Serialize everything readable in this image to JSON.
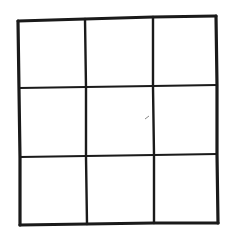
{
  "diagram": {
    "type": "grid",
    "rows": 3,
    "columns": 3,
    "stroke_color": "#1a1a1a",
    "background": "#ffffff",
    "cells": [
      {
        "row": 0,
        "col": 0,
        "content": ""
      },
      {
        "row": 0,
        "col": 1,
        "content": ""
      },
      {
        "row": 0,
        "col": 2,
        "content": ""
      },
      {
        "row": 1,
        "col": 0,
        "content": ""
      },
      {
        "row": 1,
        "col": 1,
        "content": ""
      },
      {
        "row": 1,
        "col": 2,
        "content": ""
      },
      {
        "row": 2,
        "col": 0,
        "content": ""
      },
      {
        "row": 2,
        "col": 1,
        "content": ""
      },
      {
        "row": 2,
        "col": 2,
        "content": ""
      }
    ]
  }
}
